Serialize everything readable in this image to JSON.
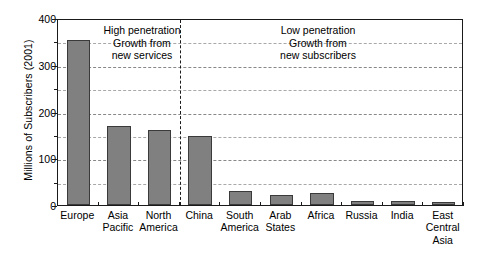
{
  "chart_data": {
    "type": "bar",
    "title": "",
    "xlabel": "",
    "ylabel": "Millions of Subscribers (2001)",
    "ylim": [
      0,
      400
    ],
    "yticks": [
      0,
      100,
      200,
      300,
      400
    ],
    "yticklabels": [
      "0",
      "100",
      "200",
      "300",
      "400"
    ],
    "minor_gridlines": [
      50,
      150,
      250,
      350
    ],
    "grid": true,
    "legend": "none",
    "categories": [
      "Europe",
      "Asia\nPacific",
      "North\nAmerica",
      "China",
      "South\nAmerica",
      "Arab\nStates",
      "Africa",
      "Russia",
      "India",
      "East\nCentral\nAsia"
    ],
    "values": [
      352,
      170,
      160,
      147,
      30,
      22,
      25,
      8,
      8,
      7
    ],
    "bar_color": "#808080",
    "bar_edge_color": "#3a3a3a",
    "annotations": [
      {
        "name": "high-penetration-note",
        "text": "High penetration\nGrowth from\nnew services"
      },
      {
        "name": "low-penetration-note",
        "text": "Low penetration\nGrowth from\nnew subscribers"
      }
    ],
    "divider": {
      "after_category": "North America",
      "style": "dashed",
      "color": "#1a1a1a"
    }
  }
}
